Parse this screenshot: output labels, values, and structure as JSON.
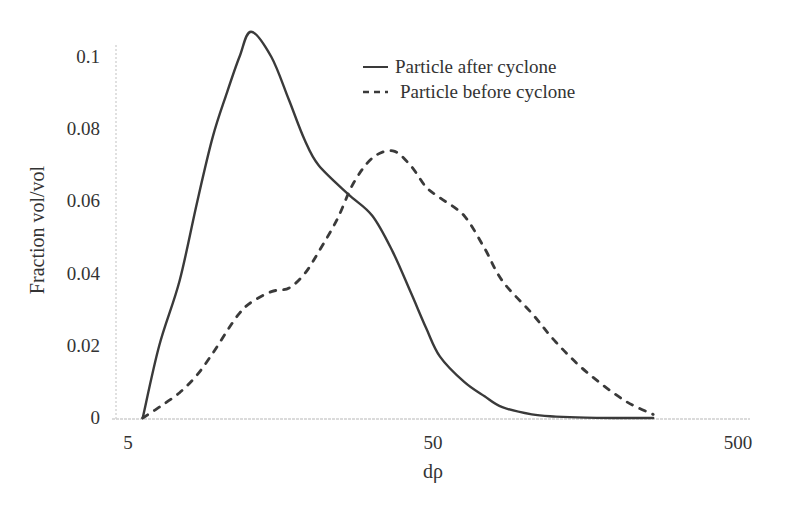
{
  "chart_data": {
    "type": "line",
    "title": "",
    "xlabel": "dρ",
    "ylabel": "Fraction vol/vol",
    "x_scale": "log",
    "xlim": [
      5,
      500
    ],
    "ylim": [
      0,
      0.11
    ],
    "x_ticks": [
      "5",
      "50",
      "500"
    ],
    "y_ticks": [
      "0",
      "0.02",
      "0.04",
      "0.06",
      "0.08",
      "0.1"
    ],
    "grid": false,
    "legend_position": "upper right",
    "series": [
      {
        "name": "Particle after cyclone",
        "style": "solid",
        "color": "#3a3a3a",
        "x": [
          5.3,
          6,
          7,
          8,
          9,
          10,
          11,
          12,
          14,
          16,
          18,
          20,
          25,
          30,
          35,
          40,
          45,
          50,
          60,
          70,
          80,
          100,
          120,
          150,
          200,
          250
        ],
        "y": [
          0,
          0.02,
          0.038,
          0.06,
          0.078,
          0.09,
          0.1,
          0.107,
          0.1,
          0.088,
          0.077,
          0.07,
          0.062,
          0.056,
          0.046,
          0.035,
          0.025,
          0.017,
          0.01,
          0.006,
          0.003,
          0.001,
          0.0004,
          0.0001,
          0,
          0
        ]
      },
      {
        "name": "Particle before cyclone",
        "style": "dashed",
        "color": "#3a3a3a",
        "x": [
          5.3,
          6,
          7,
          8,
          9,
          10,
          11,
          12,
          14,
          16,
          18,
          20,
          23,
          26,
          30,
          35,
          40,
          45,
          50,
          60,
          70,
          80,
          100,
          120,
          150,
          200,
          250
        ],
        "y": [
          0,
          0.003,
          0.007,
          0.012,
          0.018,
          0.024,
          0.029,
          0.032,
          0.035,
          0.036,
          0.04,
          0.046,
          0.055,
          0.065,
          0.072,
          0.074,
          0.07,
          0.064,
          0.061,
          0.056,
          0.047,
          0.038,
          0.029,
          0.021,
          0.013,
          0.005,
          0.001
        ]
      }
    ]
  },
  "axes": {
    "xlabel": "dρ",
    "ylabel": "Fraction vol/vol",
    "x_ticks": [
      {
        "label": "5",
        "value": 5
      },
      {
        "label": "50",
        "value": 50
      },
      {
        "label": "500",
        "value": 500
      }
    ],
    "y_ticks": [
      {
        "label": "0",
        "value": 0
      },
      {
        "label": "0.02",
        "value": 0.02
      },
      {
        "label": "0.04",
        "value": 0.04
      },
      {
        "label": "0.06",
        "value": 0.06
      },
      {
        "label": "0.08",
        "value": 0.08
      },
      {
        "label": "0.1",
        "value": 0.1
      }
    ]
  },
  "legend": {
    "items": [
      {
        "label": "Particle after cyclone",
        "style": "solid"
      },
      {
        "label": "Particle before cyclone",
        "style": "dashed"
      }
    ]
  },
  "colors": {
    "line": "#3a3a3a",
    "axis": "#c8c8c8",
    "text": "#333333"
  }
}
